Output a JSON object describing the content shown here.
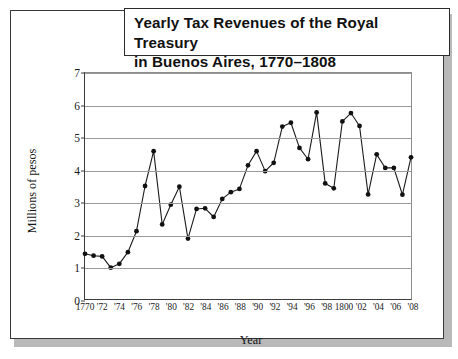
{
  "title": "Yearly Tax Revenues of the Royal Treasury\nin Buenos Aires, 1770–1808",
  "chart_data": {
    "type": "line",
    "title": "Yearly Tax Revenues of the Royal Treasury in Buenos Aires, 1770–1808",
    "xlabel": "Year",
    "ylabel": "Millions of pesos",
    "ylim": [
      0,
      7
    ],
    "xlim": [
      1770,
      1808
    ],
    "yticks": [
      0,
      1,
      2,
      3,
      4,
      5,
      6,
      7
    ],
    "ytick_labels": [
      "0",
      "1",
      "2",
      "3",
      "4",
      "5",
      "6",
      "7"
    ],
    "xticks": [
      1770,
      1772,
      1774,
      1776,
      1778,
      1780,
      1782,
      1784,
      1786,
      1788,
      1790,
      1792,
      1794,
      1796,
      1798,
      1800,
      1802,
      1804,
      1806,
      1808
    ],
    "xtick_labels": [
      "1770",
      "'72",
      "'74",
      "'76",
      "'78",
      "'80",
      "'82",
      "'84",
      "'86",
      "'88",
      "'90",
      "'92",
      "'94",
      "'96",
      "'98",
      "1800",
      "'02",
      "'04",
      "'06",
      "'08"
    ],
    "grid": "horizontal",
    "legend": "none",
    "marker": "filled-circle",
    "line_color": "#1a1a1a",
    "marker_color": "#111111",
    "grid_color": "#9a9a9a",
    "x": [
      1770,
      1771,
      1772,
      1773,
      1774,
      1775,
      1776,
      1777,
      1778,
      1779,
      1780,
      1781,
      1782,
      1783,
      1784,
      1785,
      1786,
      1787,
      1788,
      1789,
      1790,
      1791,
      1792,
      1793,
      1794,
      1795,
      1796,
      1797,
      1798,
      1799,
      1800,
      1801,
      1802,
      1803,
      1804,
      1805,
      1806,
      1807,
      1808
    ],
    "values": [
      1.4,
      1.34,
      1.32,
      0.97,
      1.09,
      1.45,
      2.1,
      3.5,
      4.58,
      2.31,
      2.92,
      3.48,
      1.87,
      2.79,
      2.81,
      2.54,
      3.1,
      3.31,
      3.41,
      4.14,
      4.58,
      3.96,
      4.22,
      5.34,
      5.46,
      4.68,
      4.33,
      5.78,
      3.58,
      3.43,
      5.5,
      5.76,
      5.36,
      3.24,
      4.48,
      4.06,
      4.06,
      3.23,
      4.39
    ],
    "series": [
      {
        "name": "Yearly tax revenues",
        "values": [
          1.4,
          1.34,
          1.32,
          0.97,
          1.09,
          1.45,
          2.1,
          3.5,
          4.58,
          2.31,
          2.92,
          3.48,
          1.87,
          2.79,
          2.81,
          2.54,
          3.1,
          3.31,
          3.41,
          4.14,
          4.58,
          3.96,
          4.22,
          5.34,
          5.46,
          4.68,
          4.33,
          5.78,
          3.58,
          3.43,
          5.5,
          5.76,
          5.36,
          3.24,
          4.48,
          4.06,
          4.06,
          3.23,
          4.39
        ]
      }
    ]
  }
}
